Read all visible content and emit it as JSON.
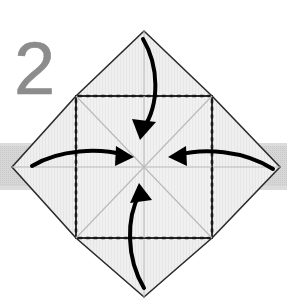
{
  "figure": {
    "kind": "origami-fold-diagram",
    "step_number_label": "2",
    "width": 287,
    "height": 301,
    "background_color": "#ffffff"
  },
  "colors": {
    "step_number": "#8c8c8c",
    "paper_fill": "#f0f0f0",
    "paper_fill_flap": "#eeeeee",
    "paper_outline": "#2b2b2b",
    "crease_line": "#b9b9b9",
    "dotted_fold_line": "#1a1a1a",
    "arrow": "#000000",
    "band_gray": "#d2d2d2"
  },
  "step_number": {
    "value": "2",
    "x": 14,
    "y": 94,
    "font_size": 74
  },
  "background_band": {
    "name": "gray-horizontal-band",
    "x": 0,
    "y": 143,
    "width": 287,
    "height": 47,
    "color": "#d2d2d2"
  },
  "center_square": {
    "name": "center-square",
    "left": 76,
    "top": 96,
    "right": 212,
    "bottom": 238,
    "center_x": 144,
    "center_y": 167,
    "points": "76,96 212,96 212,238 76,238"
  },
  "flaps": [
    {
      "name": "flap-top",
      "apex_x": 144,
      "apex_y": 31,
      "points": "76,96 212,96 144,31",
      "fold_edge": "76,96 212,96"
    },
    {
      "name": "flap-right",
      "apex_x": 280,
      "apex_y": 167,
      "points": "212,96 212,238 280,167",
      "fold_edge": "212,96 212,238"
    },
    {
      "name": "flap-bottom",
      "apex_x": 144,
      "apex_y": 297,
      "points": "76,238 212,238 144,297",
      "fold_edge": "76,238 212,238"
    },
    {
      "name": "flap-left",
      "apex_x": 12,
      "apex_y": 167,
      "points": "76,96 76,238 12,167",
      "fold_edge": "76,96 76,238"
    }
  ],
  "crease_lines": [
    {
      "name": "crease-diagonal-nw-se",
      "x1": 76,
      "y1": 96,
      "x2": 212,
      "y2": 238
    },
    {
      "name": "crease-diagonal-ne-sw",
      "x1": 212,
      "y1": 96,
      "x2": 76,
      "y2": 238
    },
    {
      "name": "crease-vertical-median",
      "x1": 144,
      "y1": 96,
      "x2": 144,
      "y2": 238
    },
    {
      "name": "crease-horizontal-median",
      "x1": 76,
      "y1": 167,
      "x2": 212,
      "y2": 167
    },
    {
      "name": "crease-flap-top-center",
      "x1": 144,
      "y1": 31,
      "x2": 144,
      "y2": 96
    },
    {
      "name": "crease-flap-bottom-center",
      "x1": 144,
      "y1": 238,
      "x2": 144,
      "y2": 297
    },
    {
      "name": "crease-flap-left-center",
      "x1": 12,
      "y1": 167,
      "x2": 76,
      "y2": 167
    },
    {
      "name": "crease-flap-right-center",
      "x1": 212,
      "y1": 167,
      "x2": 280,
      "y2": 167
    }
  ],
  "fold_lines_dotted": [
    {
      "name": "fold-line-top",
      "x1": 78,
      "y1": 96,
      "x2": 210,
      "y2": 96
    },
    {
      "name": "fold-line-right",
      "x1": 212,
      "y1": 98,
      "x2": 212,
      "y2": 236
    },
    {
      "name": "fold-line-bottom",
      "x1": 78,
      "y1": 238,
      "x2": 210,
      "y2": 238
    },
    {
      "name": "fold-line-left",
      "x1": 76,
      "y1": 98,
      "x2": 76,
      "y2": 236
    }
  ],
  "arrows": [
    {
      "name": "arrow-top-fold-down",
      "direction": "down",
      "description": "top flap folds down to center",
      "path": "M 143 39 C 159 66 160 104 143 129",
      "head": "132,119 156,122 140,140"
    },
    {
      "name": "arrow-bottom-fold-up",
      "direction": "up",
      "description": "bottom flap folds up to center",
      "path": "M 144 288 C 126 258 126 218 140 193",
      "head": "130,203 152,200 139,183"
    },
    {
      "name": "arrow-left-fold-right",
      "direction": "right",
      "description": "left flap folds right to center",
      "path": "M 32 166 C 60 149 100 148 124 155",
      "head": "116,146 134,157 115,166"
    },
    {
      "name": "arrow-right-fold-left",
      "direction": "left",
      "description": "right flap folds left to center",
      "path": "M 273 169 C 243 150 203 148 178 155",
      "head": "186,146 168,157 187,166"
    }
  ]
}
